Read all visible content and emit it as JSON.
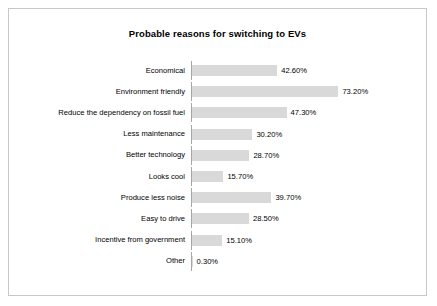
{
  "chart_data": {
    "type": "bar",
    "orientation": "horizontal",
    "title": "Probable reasons for switching to EVs",
    "xlabel": "",
    "ylabel": "",
    "grid": false,
    "legend": null,
    "xlim": [
      0,
      80
    ],
    "value_suffix": "%",
    "categories": [
      "Economical",
      "Environment friendly",
      "Reduce the dependency on fossil fuel",
      "Less maintenance",
      "Better technology",
      "Looks cool",
      "Produce less noise",
      "Easy to drive",
      "Incentive from government",
      "Other"
    ],
    "values": [
      42.6,
      73.2,
      47.3,
      30.2,
      28.7,
      15.7,
      39.7,
      28.5,
      15.1,
      0.3
    ],
    "labels": [
      "42.60%",
      "73.20%",
      "47.30%",
      "30.20%",
      "28.70%",
      "15.70%",
      "39.70%",
      "28.50%",
      "15.10%",
      "0.30%"
    ],
    "bar_color": "#d9d9d9",
    "axis_color": "#a6a6a6",
    "border_color": "#c8c8c8",
    "text_color": "#000000"
  }
}
